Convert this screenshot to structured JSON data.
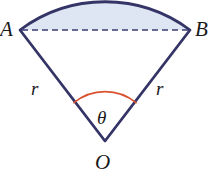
{
  "figure": {
    "type": "geometry-diagram",
    "width": 217,
    "height": 186,
    "background_color": "#ffffff"
  },
  "colors": {
    "stroke_navy": "#343466",
    "segment_fill": "#dde6f2",
    "angle_arc_orange": "#d9512f",
    "chord_dashed": "#3b3b73",
    "label_text": "#1a1a1a"
  },
  "labels": {
    "point_a": "A",
    "point_b": "B",
    "point_o": "O",
    "radius_left": "r",
    "radius_right": "r",
    "angle": "θ"
  },
  "geometry": {
    "center_o": {
      "x": 105,
      "y": 141
    },
    "point_a": {
      "x": 20,
      "y": 30
    },
    "point_b": {
      "x": 190,
      "y": 30
    },
    "arc_apex": {
      "x": 105,
      "y": 2
    },
    "chord_y": 30,
    "angle_arc_radius": 48,
    "radius_px": 140,
    "chord_dash_pattern": "6 4",
    "stroke_width": 2.6
  },
  "elements": {
    "sector_outline": "sector-outline",
    "segment_region": "shaded-circular-segment",
    "chord": "dashed-chord-ab",
    "angle_marker": "angle-arc-theta",
    "radius_left_line": "radius-oa",
    "radius_right_line": "radius-ob"
  }
}
